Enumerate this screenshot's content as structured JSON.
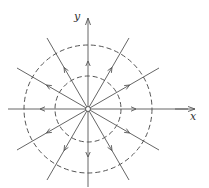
{
  "diagram": {
    "type": "radial vector field (source at origin)",
    "center": [
      88,
      109
    ],
    "axes": {
      "x_label": "x",
      "y_label": "y"
    },
    "radial_lines": {
      "count": 12,
      "angle_step_deg": 30,
      "arrow_direction": "outward"
    },
    "circles": [
      {
        "name": "inner-dashed-circle",
        "radius": 33,
        "style": "dashed"
      },
      {
        "name": "outer-dashed-circle",
        "radius": 64,
        "style": "dashed"
      }
    ],
    "origin_marker": "small open circle",
    "colors": {
      "line": "#555555",
      "background": "#ffffff"
    }
  }
}
